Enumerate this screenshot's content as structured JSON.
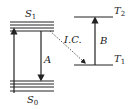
{
  "diagram": {
    "type": "energy-level-diagram",
    "levels": {
      "S1": {
        "label": "S",
        "subscript": "1"
      },
      "S0": {
        "label": "S",
        "subscript": "0"
      },
      "T2": {
        "label": "T",
        "subscript": "2"
      },
      "T1": {
        "label": "T",
        "subscript": "1"
      }
    },
    "transitions": {
      "absorption": {
        "from": "S0",
        "to": "S1",
        "label": ""
      },
      "A": {
        "from": "S1",
        "to": "S0",
        "label": "A"
      },
      "IC": {
        "from": "S1",
        "to": "T1",
        "label": "I.C.",
        "style": "dashed"
      },
      "B": {
        "from": "T1",
        "to": "T2",
        "label": "B"
      }
    },
    "colors": {
      "ink": "#222222",
      "background": "#ffffff"
    }
  }
}
